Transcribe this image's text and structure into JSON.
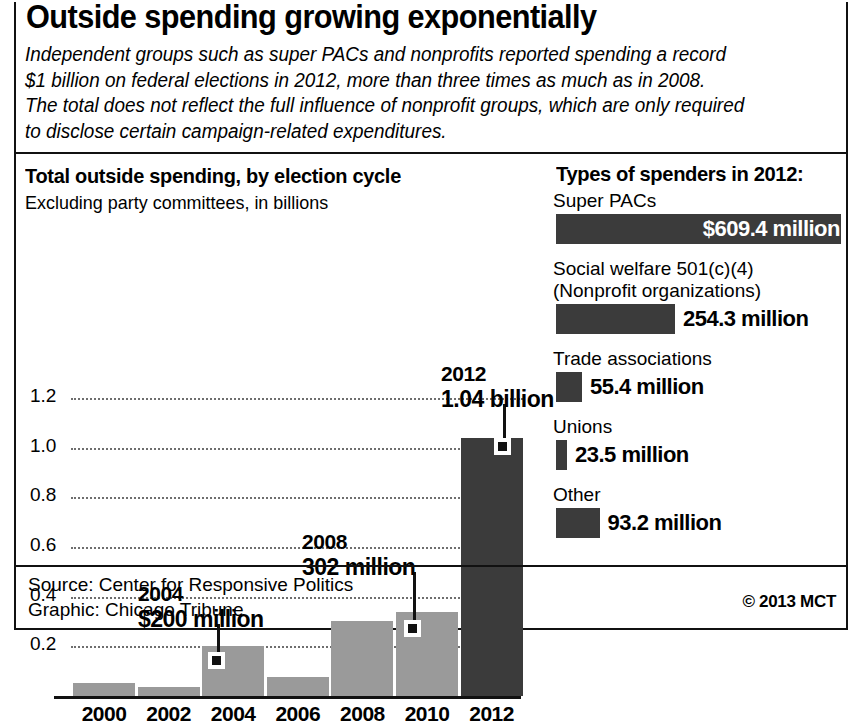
{
  "headline": "Outside spending growing exponentially",
  "deck": [
    "Independent groups such as super PACs and nonprofits reported spending a record",
    "$1 billion on federal elections in 2012, more than three times as much as in 2008.",
    "The total does not reflect the full influence of nonprofit groups, which are only required",
    "to disclose certain campaign-related expenditures."
  ],
  "footer": {
    "source": "Source: Center for Responsive Politics",
    "graphic": "Graphic: Chicago Tribune",
    "copyright": "© 2013 MCT"
  },
  "colors": {
    "bar_gray": "#9a9a9a",
    "bar_dark": "#3b3b3b",
    "ink": "#111111",
    "gridline": "#6e6e6e"
  },
  "chart_data": [
    {
      "type": "bar",
      "title": "Total outside spending, by election cycle",
      "subtitle": "Excluding party committees, in billions",
      "xlabel": "",
      "ylabel": "",
      "unit": "billions of dollars",
      "ylim": [
        0,
        1.2
      ],
      "grid": true,
      "ytick_labels": [
        "1.2",
        "1.0",
        "0.8",
        "0.6",
        "0.4",
        "0.2"
      ],
      "ytick_values": [
        1.2,
        1.0,
        0.8,
        0.6,
        0.4,
        0.2
      ],
      "categories": [
        "2000",
        "2002",
        "2004",
        "2006",
        "2008",
        "2010",
        "2012"
      ],
      "values": [
        0.053,
        0.035,
        0.2,
        0.076,
        0.302,
        0.34,
        1.04
      ],
      "bar_colors": [
        "#9a9a9a",
        "#9a9a9a",
        "#9a9a9a",
        "#9a9a9a",
        "#9a9a9a",
        "#9a9a9a",
        "#3b3b3b"
      ],
      "annotations": [
        {
          "category": "2004",
          "year": "2004",
          "value_label": "$200 million",
          "value": 0.2
        },
        {
          "category": "2008",
          "year": "2008",
          "value_label": "302 million",
          "value": 0.302
        },
        {
          "category": "2012",
          "year": "2012",
          "value_label": "1.04 billion",
          "value": 1.04
        }
      ]
    },
    {
      "type": "bar",
      "title": "Types of spenders in 2012:",
      "orientation": "horizontal",
      "unit": "millions of dollars",
      "categories": [
        "Super PACs",
        "Social welfare 501(c)(4)",
        "Trade associations",
        "Unions",
        "Other"
      ],
      "values": [
        609.4,
        254.3,
        55.4,
        23.5,
        93.2
      ],
      "value_labels": [
        "$609.4 million",
        "254.3 million",
        "55.4 million",
        "23.5 million",
        "93.2 million"
      ],
      "items": [
        {
          "label_line1": "Super PACs",
          "label_line2": "",
          "value": 609.4,
          "value_label": "$609.4 million",
          "label_inside": true
        },
        {
          "label_line1": "Social welfare 501(c)(4)",
          "label_line2": "(Nonprofit organizations)",
          "value": 254.3,
          "value_label": "254.3 million",
          "label_inside": false
        },
        {
          "label_line1": "Trade associations",
          "label_line2": "",
          "value": 55.4,
          "value_label": "55.4 million",
          "label_inside": false
        },
        {
          "label_line1": "Unions",
          "label_line2": "",
          "value": 23.5,
          "value_label": "23.5 million",
          "label_inside": false
        },
        {
          "label_line1": "Other",
          "label_line2": "",
          "value": 93.2,
          "value_label": "93.2 million",
          "label_inside": false
        }
      ]
    }
  ]
}
